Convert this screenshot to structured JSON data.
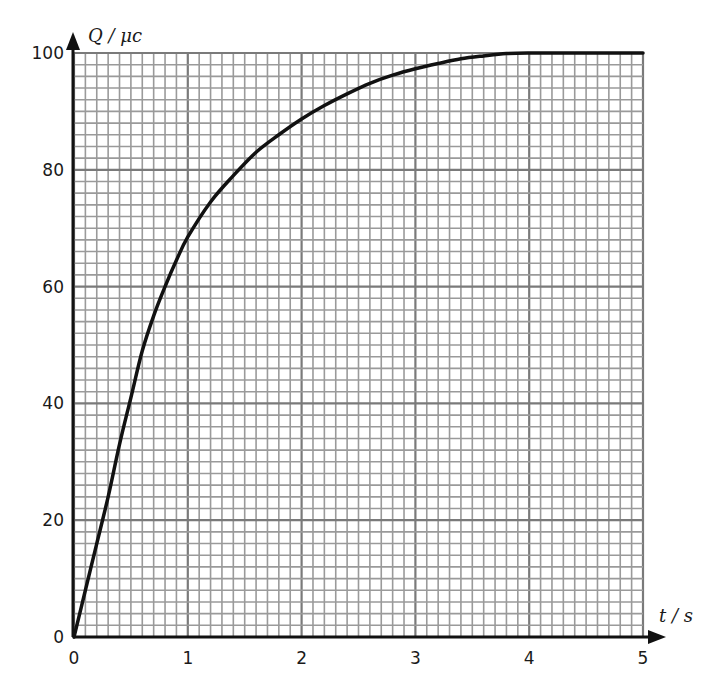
{
  "chart_data": {
    "type": "line",
    "title": "",
    "xlabel": "t / s",
    "ylabel": "Q / μc",
    "xlim": [
      0,
      5
    ],
    "ylim": [
      0,
      100
    ],
    "x_ticks": [
      0,
      1,
      2,
      3,
      4,
      5
    ],
    "y_ticks": [
      0,
      20,
      40,
      60,
      80,
      100
    ],
    "x_tick_labels": [
      "0",
      "1",
      "2",
      "3",
      "4",
      "5"
    ],
    "y_tick_labels": [
      "0",
      "20",
      "40",
      "60",
      "80",
      "100"
    ],
    "grid": {
      "on": true,
      "x_minor_step": 0.1,
      "y_minor_step": 2,
      "x_major_step": 1,
      "y_major_step": 20,
      "style": "graph paper"
    },
    "legend": null,
    "series": [
      {
        "name": "Q",
        "x": [
          0,
          0.1,
          0.2,
          0.3,
          0.4,
          0.5,
          0.6,
          0.7,
          0.8,
          0.9,
          1.0,
          1.2,
          1.4,
          1.6,
          1.8,
          2.0,
          2.2,
          2.4,
          2.6,
          2.8,
          3.0,
          3.2,
          3.4,
          3.6,
          3.8,
          4.0,
          4.5,
          5.0
        ],
        "values": [
          0,
          8,
          16,
          24,
          33,
          41,
          49,
          55,
          60,
          64.5,
          68.5,
          74.5,
          79,
          83,
          86,
          88.7,
          91,
          93,
          94.8,
          96.2,
          97.3,
          98.2,
          99,
          99.5,
          99.9,
          100,
          100,
          100
        ]
      }
    ]
  },
  "colors": {
    "curve": "#111111",
    "axis": "#111111",
    "grid_minor": "#9a9a9a",
    "grid_major": "#7a7a7a",
    "background": "#ffffff"
  }
}
